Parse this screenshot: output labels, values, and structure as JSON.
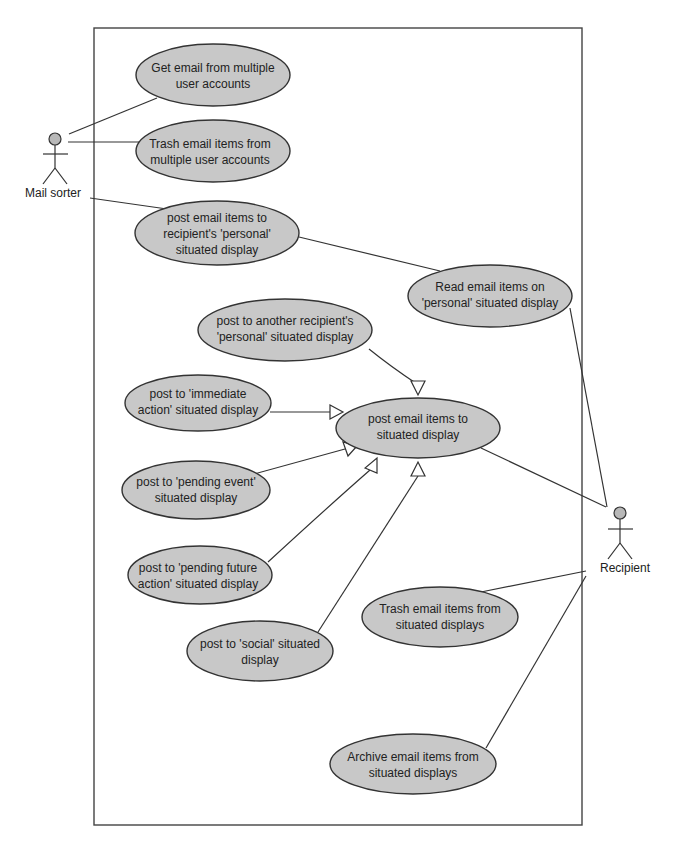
{
  "diagram": {
    "type": "UML use case diagram",
    "actors": [
      {
        "id": "mail_sorter",
        "label": "Mail sorter"
      },
      {
        "id": "recipient",
        "label": "Recipient"
      }
    ],
    "use_cases": {
      "get_email": {
        "line1": "Get email from multiple",
        "line2": "user accounts"
      },
      "trash_multiple": {
        "line1": "Trash email items from",
        "line2": "multiple user accounts"
      },
      "post_personal": {
        "line1": "post email items to",
        "line2": "recipient's 'personal'",
        "line3": "situated display"
      },
      "read_personal": {
        "line1": "Read email items on",
        "line2": "'personal' situated display"
      },
      "post_another": {
        "line1": "post to another recipient's",
        "line2": "'personal' situated display"
      },
      "post_immediate": {
        "line1": "post to 'immediate",
        "line2": "action' situated display"
      },
      "post_situated": {
        "line1": "post email items to",
        "line2": "situated display"
      },
      "post_pending_event": {
        "line1": "post to 'pending event'",
        "line2": "situated display"
      },
      "post_pending_future": {
        "line1": "post to 'pending future",
        "line2": "action' situated display"
      },
      "post_social": {
        "line1": "post to 'social' situated",
        "line2": "display"
      },
      "trash_situated": {
        "line1": "Trash email items from",
        "line2": "situated displays"
      },
      "archive_situated": {
        "line1": "Archive email items from",
        "line2": "situated displays"
      }
    },
    "associations": [
      {
        "from": "mail_sorter",
        "to": "get_email"
      },
      {
        "from": "mail_sorter",
        "to": "trash_multiple"
      },
      {
        "from": "mail_sorter",
        "to": "post_personal"
      },
      {
        "from": "post_personal",
        "to": "read_personal"
      },
      {
        "from": "recipient",
        "to": "read_personal"
      },
      {
        "from": "recipient",
        "to": "post_situated"
      },
      {
        "from": "recipient",
        "to": "trash_situated"
      },
      {
        "from": "recipient",
        "to": "archive_situated"
      }
    ],
    "generalizations": [
      {
        "child": "post_another",
        "parent": "post_situated"
      },
      {
        "child": "post_immediate",
        "parent": "post_situated"
      },
      {
        "child": "post_pending_event",
        "parent": "post_situated"
      },
      {
        "child": "post_pending_future",
        "parent": "post_situated"
      },
      {
        "child": "post_social",
        "parent": "post_situated"
      }
    ],
    "colors": {
      "ellipse_fill": "#c8c8c8",
      "stroke": "#333333",
      "background": "#ffffff"
    }
  }
}
